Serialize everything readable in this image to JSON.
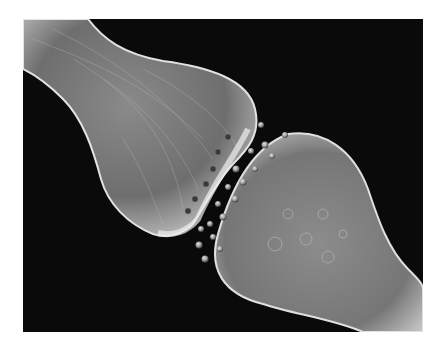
{
  "image": {
    "subject": "3D rendering of a neural synapse with neurotransmitter vesicles crossing the synaptic cleft",
    "background_color": "#0a0a0a",
    "frame_color": "#ffffff",
    "structure_color": "#9a9a9a",
    "highlight_color": "#e6e6e6"
  }
}
